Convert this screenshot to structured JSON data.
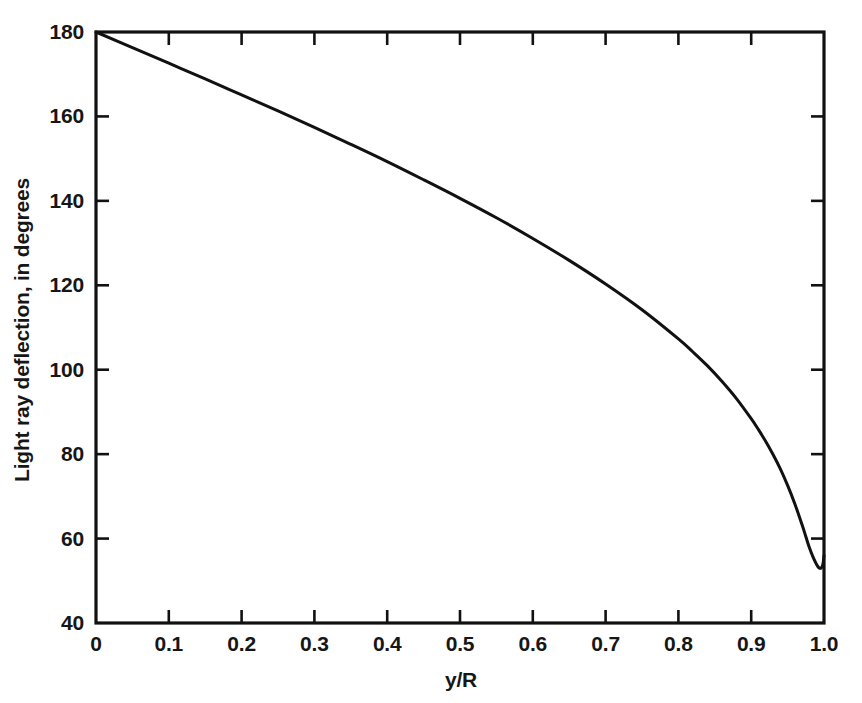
{
  "chart_data": {
    "type": "line",
    "title": "",
    "xlabel": "y/R",
    "ylabel": "Light ray deflection, in degrees",
    "xlim": [
      0,
      1.0
    ],
    "ylim": [
      40,
      180
    ],
    "grid": false,
    "legend": null,
    "x_ticks": [
      "0",
      "0.1",
      "0.2",
      "0.3",
      "0.4",
      "0.5",
      "0.6",
      "0.7",
      "0.8",
      "0.9",
      "1.0"
    ],
    "x_tick_values": [
      0,
      0.1,
      0.2,
      0.3,
      0.4,
      0.5,
      0.6,
      0.7,
      0.8,
      0.9,
      1.0
    ],
    "y_ticks": [
      "40",
      "60",
      "80",
      "100",
      "120",
      "140",
      "160",
      "180"
    ],
    "y_tick_values": [
      40,
      60,
      80,
      100,
      120,
      140,
      160,
      180
    ],
    "line_color": "#111111",
    "line_width": 3,
    "series": [
      {
        "name": "Light ray deflection",
        "x": [
          0.0,
          0.05,
          0.1,
          0.15,
          0.2,
          0.25,
          0.3,
          0.35,
          0.4,
          0.45,
          0.5,
          0.55,
          0.6,
          0.65,
          0.7,
          0.75,
          0.8,
          0.82,
          0.84,
          0.86,
          0.88,
          0.9,
          0.91,
          0.92,
          0.93,
          0.94,
          0.95,
          0.96,
          0.97,
          0.975,
          0.98,
          0.985,
          0.99,
          0.993,
          0.996,
          0.998,
          0.999,
          1.0
        ],
        "y": [
          180.0,
          176.3,
          172.6,
          168.9,
          165.1,
          161.3,
          157.4,
          153.4,
          149.3,
          145.0,
          140.6,
          136.0,
          131.1,
          125.9,
          120.3,
          114.2,
          107.3,
          104.2,
          100.9,
          97.2,
          93.1,
          88.4,
          85.8,
          83.0,
          79.9,
          76.5,
          72.6,
          68.2,
          63.2,
          60.5,
          57.8,
          55.6,
          53.8,
          53.1,
          53.0,
          53.6,
          54.4,
          56.0
        ],
        "color": "#111111"
      }
    ],
    "minimum_point": {
      "x": 0.955,
      "y": 53.0,
      "note": "rainbow angle minimum"
    },
    "endpoint_value_at_x1": 68.0,
    "start_value_at_x0": 180.0
  },
  "axes": {
    "frame_color": "#111111",
    "frame_width": 3,
    "tick_direction": "in",
    "background": "#ffffff"
  }
}
